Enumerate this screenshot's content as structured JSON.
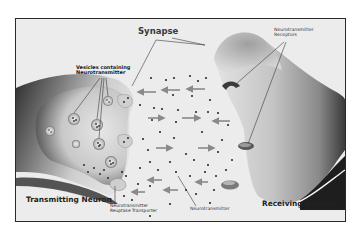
{
  "diagram": {
    "title": "Synapse",
    "labels": {
      "synapse": "Synapse",
      "vesicles_line1": "Vesicles containing",
      "vesicles_line2": "Neurotransmitter",
      "receptors_line1": "Neurotransmitter",
      "receptors_line2": "Receptors",
      "transmitting_neuron": "Transmitting Neuron",
      "receiving_neuron": "Receiving Neuron",
      "reuptake_line1": "Neurotransmitter",
      "reuptake_line2": "Reuptake Transporter",
      "neurotransmitter": "Neurotransmitter"
    },
    "components": [
      {
        "id": "transmitting-neuron",
        "label": "Transmitting Neuron",
        "side": "left"
      },
      {
        "id": "receiving-neuron",
        "label": "Receiving Neuron",
        "side": "right"
      },
      {
        "id": "synaptic-cleft",
        "label": "Synapse",
        "position": "center"
      },
      {
        "id": "vesicles",
        "label": "Vesicles containing Neurotransmitter",
        "count": 7
      },
      {
        "id": "receptors",
        "label": "Neurotransmitter Receptors",
        "count": 3
      },
      {
        "id": "reuptake-transporter",
        "label": "Neurotransmitter Reuptake Transporter",
        "count": 3
      },
      {
        "id": "neurotransmitter",
        "label": "Neurotransmitter",
        "form": "dots"
      }
    ],
    "arrows": {
      "right_pointing": 5,
      "left_pointing": 7
    },
    "colors": {
      "background": "#ececec",
      "frame": "#2a2a2a",
      "neuron_dark": "#3a3a3a",
      "neuron_light": "#d8d8d8",
      "arrow": "#8a8a8a",
      "dot": "#1e1e1e"
    }
  }
}
